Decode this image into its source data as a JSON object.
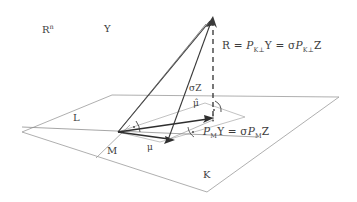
{
  "figure": {
    "background_color": "#ffffff",
    "line_color": "#4a4a4a",
    "plane_color": "#8c8c8c",
    "text_color": "#3d3d3d"
  },
  "labels": {
    "ambient_space": "R",
    "ambient_space_sup": "n",
    "vector_Y": "Y",
    "residual_eq_R": "R",
    "residual_eq_part1_op": "P",
    "residual_eq_part1_sub": "K⊥",
    "residual_eq_part1_arg": "Y",
    "residual_eq_part2_sigma": "σ",
    "residual_eq_part2_op": "P",
    "residual_eq_part2_sub": "K⊥",
    "residual_eq_part2_arg": "Z",
    "residual_eq_full": "R = P_{K⊥} Y = σP_{K⊥} Z",
    "sigma_Z": "σZ",
    "mu_hat": "μ̂",
    "mu": "μ",
    "fitted_eq_op": "P",
    "fitted_eq_sub": "M",
    "fitted_eq_arg": "Y",
    "fitted_eq_sigma": "σ",
    "fitted_eq_op2": "P",
    "fitted_eq_sub2": "M",
    "fitted_eq_arg2": "Z",
    "fitted_eq_full": "P_M Y = σP_M Z",
    "subspace_L": "L",
    "subspace_M": "M",
    "subspace_K": "K",
    "equals": "="
  },
  "geometry": {
    "plane_K": {
      "left": [
        22,
        132
      ],
      "top": [
        112,
        95
      ],
      "right": [
        339,
        97
      ],
      "bottom": [
        207,
        192
      ]
    },
    "origin": [
      118,
      132
    ],
    "apex_Y": [
      213,
      16
    ],
    "mu_hat_tip": [
      213,
      119
    ],
    "mu_tip": [
      174,
      139
    ],
    "sigma_z_base": [
      213,
      119
    ],
    "inner_plane": {
      "a": [
        118,
        132
      ],
      "b": [
        205,
        103
      ],
      "c": [
        245,
        117
      ],
      "d": [
        160,
        142
      ]
    },
    "line_L": {
      "from": [
        22,
        127
      ],
      "to": [
        255,
        136
      ]
    },
    "dashed_vertical": {
      "from": [
        213,
        22
      ],
      "to": [
        213,
        120
      ]
    },
    "right_angle_markers": [
      {
        "at": [
          133,
          127
        ],
        "type": "arc-dot"
      },
      {
        "at": [
          213,
          110
        ],
        "type": "arc-dot"
      },
      {
        "at": [
          197,
          133
        ],
        "type": "arc-dot"
      }
    ]
  },
  "label_positions": {
    "ambient_space": [
      42,
      29
    ],
    "vector_Y": [
      72,
      26
    ],
    "residual_eq": [
      76,
      45
    ],
    "sigma_Z": [
      63,
      85
    ],
    "mu_hat": [
      59,
      103
    ],
    "mu": [
      45,
      146
    ],
    "fitted_eq": [
      63,
      131
    ],
    "subspace_L": [
      13,
      118
    ],
    "subspace_M": [
      34,
      148
    ],
    "subspace_K": [
      59,
      177
    ]
  }
}
